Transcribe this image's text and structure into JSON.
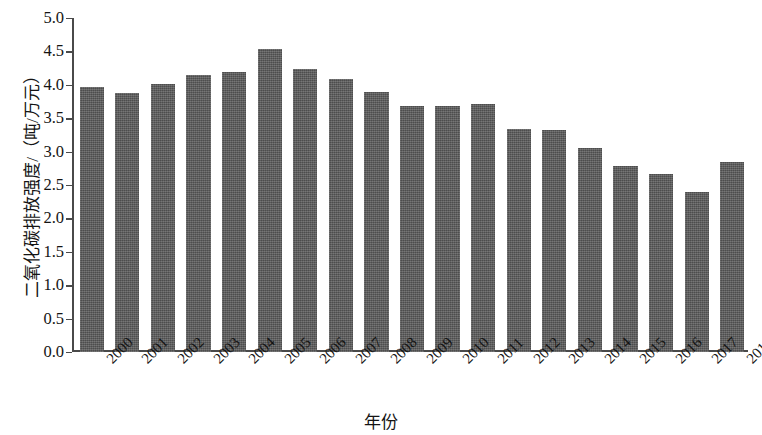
{
  "chart_data": {
    "type": "bar",
    "title": "",
    "xlabel": "年份",
    "ylabel": "二氧化碳排放强度/（吨/万元）",
    "categories": [
      "2000",
      "2001",
      "2002",
      "2003",
      "2004",
      "2005",
      "2006",
      "2007",
      "2008",
      "2009",
      "2010",
      "2011",
      "2012",
      "2013",
      "2014",
      "2015",
      "2016",
      "2017",
      "2018"
    ],
    "values": [
      3.96,
      3.87,
      4.01,
      4.14,
      4.19,
      4.54,
      4.24,
      4.08,
      3.89,
      3.68,
      3.69,
      3.72,
      3.34,
      3.32,
      3.05,
      2.79,
      2.66,
      2.4,
      2.85
    ],
    "ylim": [
      0.0,
      5.0
    ],
    "ytick_labels": [
      "0.0",
      "0.5",
      "1.0",
      "1.5",
      "2.0",
      "2.5",
      "3.0",
      "3.5",
      "4.0",
      "4.5",
      "5.0"
    ],
    "ytick_values": [
      0.0,
      0.5,
      1.0,
      1.5,
      2.0,
      2.5,
      3.0,
      3.5,
      4.0,
      4.5,
      5.0
    ],
    "grid": false,
    "legend": null,
    "bar_color": "#5a5a5a",
    "axis_color": "#4a4a4a",
    "text_color": "#141414"
  }
}
